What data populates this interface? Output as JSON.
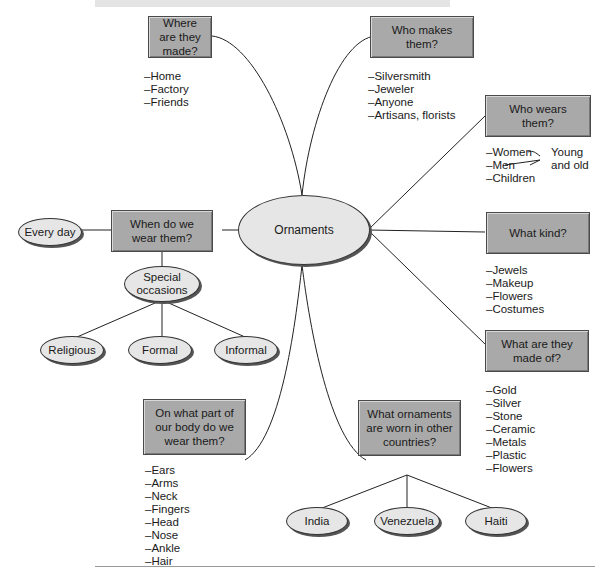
{
  "center": {
    "label": "Ornaments"
  },
  "nodes": {
    "where": {
      "question": "Where are they made?",
      "items": [
        "Home",
        "Factory",
        "Friends"
      ]
    },
    "who_makes": {
      "question": "Who makes them?",
      "items": [
        "Silversmith",
        "Jeweler",
        "Anyone",
        "Artisans, florists"
      ]
    },
    "who_wears": {
      "question": "Who wears them?",
      "items": [
        "Women",
        "Men",
        "Children"
      ],
      "bracket_note": "Young and old"
    },
    "when": {
      "question": "When do we wear them?",
      "everyday": "Every day",
      "special": "Special occasions",
      "occasions": [
        "Religious",
        "Formal",
        "Informal"
      ]
    },
    "what_kind": {
      "question": "What kind?",
      "items": [
        "Jewels",
        "Makeup",
        "Flowers",
        "Costumes"
      ]
    },
    "made_of": {
      "question": "What are they made of?",
      "items": [
        "Gold",
        "Silver",
        "Stone",
        "Ceramic",
        "Metals",
        "Plastic",
        "Flowers"
      ]
    },
    "body": {
      "question": "On what part of our body do we wear them?",
      "items": [
        "Ears",
        "Arms",
        "Neck",
        "Fingers",
        "Head",
        "Nose",
        "Ankle",
        "Hair"
      ]
    },
    "countries": {
      "question": "What ornaments are worn in other countries?",
      "examples": [
        "India",
        "Venezuela",
        "Haiti"
      ]
    }
  }
}
